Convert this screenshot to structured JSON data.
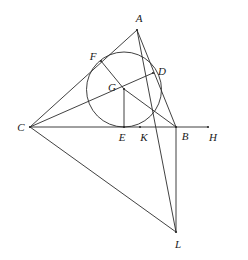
{
  "figure": {
    "canvas": {
      "width": 248,
      "height": 260
    },
    "style": {
      "stroke_color": "#2b2b2b",
      "background_color": "#ffffff",
      "circle_stroke_color": "#2b2b2b",
      "stroke_width": 0.9,
      "label_color": "#1a1a1a",
      "label_font_size": 11
    },
    "points": [
      {
        "id": "A",
        "label": "A",
        "x": 137,
        "y": 30,
        "label_x": 139,
        "label_y": 18
      },
      {
        "id": "F",
        "label": "F",
        "x": 101,
        "y": 61,
        "label_x": 93,
        "label_y": 56
      },
      {
        "id": "D",
        "label": "D",
        "x": 153,
        "y": 73,
        "label_x": 162,
        "label_y": 71
      },
      {
        "id": "G",
        "label": "G",
        "x": 124,
        "y": 89,
        "label_x": 112,
        "label_y": 87
      },
      {
        "id": "C",
        "label": "C",
        "x": 30,
        "y": 127,
        "label_x": 21,
        "label_y": 127
      },
      {
        "id": "E",
        "label": "E",
        "x": 124,
        "y": 127,
        "label_x": 122,
        "label_y": 137
      },
      {
        "id": "K",
        "label": "K",
        "x": 140,
        "y": 127,
        "label_x": 144,
        "label_y": 137
      },
      {
        "id": "B",
        "label": "B",
        "x": 176,
        "y": 127,
        "label_x": 185,
        "label_y": 136
      },
      {
        "id": "H",
        "label": "H",
        "x": 208,
        "y": 127,
        "label_x": 213,
        "label_y": 137
      },
      {
        "id": "L",
        "label": "L",
        "x": 176,
        "y": 232,
        "label_x": 178,
        "label_y": 244
      }
    ],
    "segments": [
      {
        "id": "side-AC",
        "name": "segment-A-C",
        "from": "A",
        "to": "C"
      },
      {
        "id": "side-AB",
        "name": "segment-A-B",
        "from": "A",
        "to": "B"
      },
      {
        "id": "side-CH",
        "name": "segment-C-H",
        "from": "C",
        "to": "H"
      },
      {
        "id": "cevian-CD",
        "name": "segment-C-D",
        "from": "C",
        "to": "D"
      },
      {
        "id": "cevian-AL",
        "name": "segment-A-L",
        "from": "A",
        "to": "L"
      },
      {
        "id": "radius-GF",
        "name": "segment-G-F",
        "from": "G",
        "to": "F"
      },
      {
        "id": "radius-GE",
        "name": "segment-G-E",
        "from": "G",
        "to": "E"
      },
      {
        "id": "radius-GB",
        "name": "segment-G-B",
        "from": "G",
        "to": "B"
      },
      {
        "id": "side-BL",
        "name": "segment-B-L",
        "from": "B",
        "to": "L"
      },
      {
        "id": "side-CL",
        "name": "segment-C-L",
        "from": "C",
        "to": "L"
      }
    ],
    "circle": {
      "id": "incircle",
      "name": "incircle",
      "center_x": 124,
      "center_y": 89.5,
      "radius": 37.5
    }
  }
}
